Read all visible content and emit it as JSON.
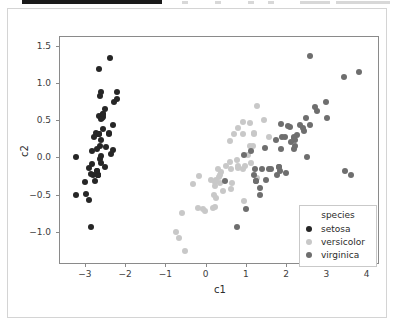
{
  "toolbar": {
    "present": true,
    "ghost_segments": [
      {
        "left": 182,
        "width": 6
      },
      {
        "left": 215,
        "width": 6
      },
      {
        "left": 248,
        "width": 6
      },
      {
        "left": 268,
        "width": 6
      },
      {
        "left": 300,
        "width": 30
      },
      {
        "left": 336,
        "width": 54
      }
    ]
  },
  "chart_data": {
    "type": "scatter",
    "title": "",
    "xlabel": "c1",
    "ylabel": "c2",
    "xlim": [
      -3.62,
      4.28
    ],
    "ylim": [
      -1.42,
      1.62
    ],
    "xticks": [
      -3,
      -2,
      -1,
      0,
      1,
      2,
      3,
      4
    ],
    "xticklabels": [
      "−3",
      "−2",
      "−1",
      "0",
      "1",
      "2",
      "3",
      "4"
    ],
    "yticks": [
      -1.0,
      -0.5,
      0.0,
      0.5,
      1.0,
      1.5
    ],
    "yticklabels": [
      "−1.0",
      "−0.5",
      "0.0",
      "0.5",
      "1.0",
      "1.5"
    ],
    "grid": false,
    "legend": {
      "title": "species",
      "position": "lower right",
      "entries": [
        {
          "name": "setosa",
          "color": "#262626"
        },
        {
          "name": "versicolor",
          "color": "#c8c8c8"
        },
        {
          "name": "virginica",
          "color": "#6e6e6e"
        }
      ]
    },
    "series": [
      {
        "name": "setosa",
        "color": "#262626",
        "points": [
          [
            -2.68,
            0.32
          ],
          [
            -2.71,
            -0.18
          ],
          [
            -2.89,
            -0.14
          ],
          [
            -2.75,
            -0.32
          ],
          [
            -2.73,
            0.33
          ],
          [
            -2.28,
            0.74
          ],
          [
            -2.82,
            -0.09
          ],
          [
            -2.63,
            0.16
          ],
          [
            -2.89,
            -0.57
          ],
          [
            -2.67,
            -0.24
          ],
          [
            -2.51,
            0.65
          ],
          [
            -2.61,
            0.02
          ],
          [
            -2.79,
            -0.23
          ],
          [
            -3.22,
            -0.51
          ],
          [
            -2.64,
            1.19
          ],
          [
            -2.38,
            1.34
          ],
          [
            -2.62,
            0.82
          ],
          [
            -2.65,
            0.32
          ],
          [
            -2.2,
            0.88
          ],
          [
            -2.59,
            0.52
          ],
          [
            -2.31,
            0.43
          ],
          [
            -2.54,
            0.55
          ],
          [
            -3.22,
            -0.0
          ],
          [
            -2.3,
            0.1
          ],
          [
            -2.36,
            0.04
          ],
          [
            -2.51,
            -0.13
          ],
          [
            -2.47,
            0.14
          ],
          [
            -2.56,
            0.38
          ],
          [
            -2.64,
            0.31
          ],
          [
            -2.63,
            -0.02
          ],
          [
            -2.59,
            -0.08
          ],
          [
            -2.41,
            0.31
          ],
          [
            -2.65,
            0.56
          ],
          [
            -2.6,
            0.88
          ],
          [
            -2.67,
            -0.24
          ],
          [
            -2.82,
            0.09
          ],
          [
            -2.58,
            0.53
          ],
          [
            -2.67,
            -0.24
          ],
          [
            -2.98,
            -0.49
          ],
          [
            -2.59,
            0.24
          ],
          [
            -2.77,
            0.27
          ],
          [
            -2.85,
            -0.93
          ],
          [
            -2.99,
            -0.33
          ],
          [
            -2.4,
            0.33
          ],
          [
            -2.2,
            0.78
          ],
          [
            -2.71,
            -0.18
          ],
          [
            -2.54,
            0.59
          ],
          [
            -2.84,
            -0.22
          ],
          [
            -2.54,
            0.58
          ],
          [
            -2.7,
            0.11
          ]
        ]
      },
      {
        "name": "versicolor",
        "color": "#c8c8c8",
        "points": [
          [
            1.28,
            0.69
          ],
          [
            0.93,
            0.32
          ],
          [
            1.46,
            0.5
          ],
          [
            0.18,
            -0.68
          ],
          [
            1.09,
            0.15
          ],
          [
            0.64,
            -0.42
          ],
          [
            1.1,
            0.46
          ],
          [
            -0.75,
            -1.0
          ],
          [
            1.04,
            0.03
          ],
          [
            -0.01,
            -0.72
          ],
          [
            -0.51,
            -1.26
          ],
          [
            0.51,
            -0.11
          ],
          [
            0.26,
            -0.55
          ],
          [
            0.98,
            -0.12
          ],
          [
            -0.17,
            -0.25
          ],
          [
            0.93,
            0.47
          ],
          [
            0.65,
            -0.35
          ],
          [
            0.22,
            -0.33
          ],
          [
            0.95,
            -0.58
          ],
          [
            0.24,
            -0.67
          ],
          [
            1.17,
            0.16
          ],
          [
            0.38,
            -0.19
          ],
          [
            1.12,
            -0.08
          ],
          [
            0.81,
            -0.14
          ],
          [
            0.61,
            0.22
          ],
          [
            0.8,
            0.39
          ],
          [
            1.2,
            0.33
          ],
          [
            1.56,
            0.27
          ],
          [
            0.81,
            -0.12
          ],
          [
            -0.31,
            -0.36
          ],
          [
            -0.07,
            -0.7
          ],
          [
            -0.19,
            -0.68
          ],
          [
            0.14,
            -0.31
          ],
          [
            1.28,
            -0.28
          ],
          [
            0.64,
            -0.16
          ],
          [
            0.7,
            0.32
          ],
          [
            1.19,
            0.31
          ],
          [
            0.93,
            -0.16
          ],
          [
            0.26,
            -0.31
          ],
          [
            0.2,
            -0.5
          ],
          [
            0.44,
            -0.45
          ],
          [
            0.78,
            -0.03
          ],
          [
            0.24,
            -0.38
          ],
          [
            -0.67,
            -1.08
          ],
          [
            0.35,
            -0.34
          ],
          [
            0.3,
            -0.15
          ],
          [
            0.35,
            -0.24
          ],
          [
            0.61,
            -0.06
          ],
          [
            -0.58,
            -0.75
          ],
          [
            0.33,
            -0.26
          ]
        ]
      },
      {
        "name": "virginica",
        "color": "#6e6e6e",
        "points": [
          [
            2.52,
            0.01
          ],
          [
            1.36,
            -0.41
          ],
          [
            2.27,
            0.3
          ],
          [
            1.58,
            -0.15
          ],
          [
            2.2,
            0.11
          ],
          [
            3.0,
            0.74
          ],
          [
            0.78,
            -0.93
          ],
          [
            2.58,
            0.44
          ],
          [
            2.0,
            -0.21
          ],
          [
            2.58,
            1.37
          ],
          [
            1.75,
            0.24
          ],
          [
            1.77,
            -0.23
          ],
          [
            2.21,
            0.24
          ],
          [
            1.36,
            -0.5
          ],
          [
            1.62,
            -0.16
          ],
          [
            1.9,
            0.27
          ],
          [
            1.87,
            0.11
          ],
          [
            3.8,
            1.15
          ],
          [
            3.61,
            -0.23
          ],
          [
            0.99,
            -0.7
          ],
          [
            2.5,
            0.53
          ],
          [
            1.25,
            -0.32
          ],
          [
            3.46,
            -0.18
          ],
          [
            1.39,
            -0.16
          ],
          [
            2.09,
            0.41
          ],
          [
            2.71,
            0.68
          ],
          [
            1.23,
            -0.16
          ],
          [
            1.12,
            0.09
          ],
          [
            1.82,
            -0.13
          ],
          [
            2.45,
            0.35
          ],
          [
            2.77,
            0.62
          ],
          [
            3.44,
            1.08
          ],
          [
            1.85,
            -0.18
          ],
          [
            1.2,
            -0.23
          ],
          [
            1.49,
            -0.31
          ],
          [
            3.01,
            0.53
          ],
          [
            1.87,
            0.45
          ],
          [
            1.47,
            0.13
          ],
          [
            0.95,
            0.03
          ],
          [
            2.2,
            0.26
          ],
          [
            2.19,
            0.27
          ],
          [
            2.13,
            0.21
          ],
          [
            1.25,
            -0.32
          ],
          [
            2.41,
            0.4
          ],
          [
            2.35,
            0.43
          ],
          [
            1.97,
            0.27
          ],
          [
            0.49,
            -0.32
          ],
          [
            2.21,
            0.15
          ],
          [
            2.04,
            0.42
          ],
          [
            1.81,
            -0.13
          ]
        ]
      }
    ]
  }
}
